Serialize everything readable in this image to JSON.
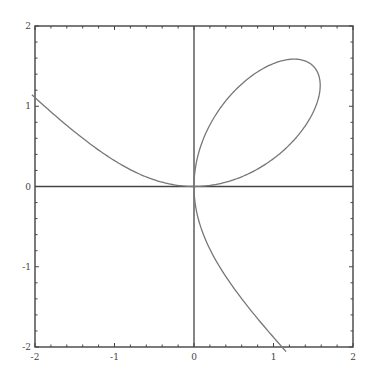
{
  "chart_data": {
    "type": "line",
    "title": "",
    "xlabel": "",
    "ylabel": "",
    "xlim": [
      -2,
      2
    ],
    "ylim": [
      -2,
      2
    ],
    "grid": false,
    "legend": null,
    "axes_through_origin": true,
    "frame": true,
    "xticks": [
      -2,
      -1,
      0,
      1,
      2
    ],
    "yticks": [
      -2,
      -1,
      0,
      1,
      2
    ],
    "xtick_labels": [
      "-2",
      "-1",
      "0",
      "1",
      "2"
    ],
    "ytick_labels": [
      "-2",
      "-1",
      "0",
      "1",
      "2"
    ],
    "minor_tick_step": 0.2,
    "curve": {
      "name": "Folium of Descartes",
      "equation": "x^3 + y^3 = 3xy",
      "parametric": {
        "x": "3t/(1+t^3)",
        "y": "3t^2/(1+t^3)"
      },
      "color": "#777777",
      "notable_points": {
        "left_tail_end": [
          -1.91,
          1.07
        ],
        "loop_top": [
          1.26,
          1.59
        ],
        "loop_right": [
          1.59,
          1.26
        ],
        "node": [
          0,
          0
        ],
        "bottom_tail_end": [
          1.07,
          -1.9
        ]
      }
    },
    "series": [
      {
        "name": "left-tail",
        "x": [
          -1.91,
          -1.6,
          -1.2,
          -0.9,
          -0.6,
          -0.4,
          -0.2,
          0
        ],
        "y": [
          1.07,
          0.85,
          0.58,
          0.39,
          0.2,
          0.1,
          0.03,
          0
        ]
      },
      {
        "name": "loop",
        "x": [
          0,
          0.2,
          0.5,
          0.9,
          1.26,
          1.5,
          1.59,
          1.5,
          1.2,
          0.8,
          0.4,
          0
        ],
        "y": [
          0,
          0.62,
          1.0,
          1.38,
          1.59,
          1.5,
          1.26,
          0.9,
          0.55,
          0.26,
          0.06,
          0
        ]
      },
      {
        "name": "bottom-tail",
        "x": [
          0,
          0.03,
          0.1,
          0.2,
          0.39,
          0.58,
          0.85,
          1.07
        ],
        "y": [
          0,
          -0.2,
          -0.4,
          -0.6,
          -0.9,
          -1.2,
          -1.6,
          -1.9
        ]
      }
    ]
  }
}
